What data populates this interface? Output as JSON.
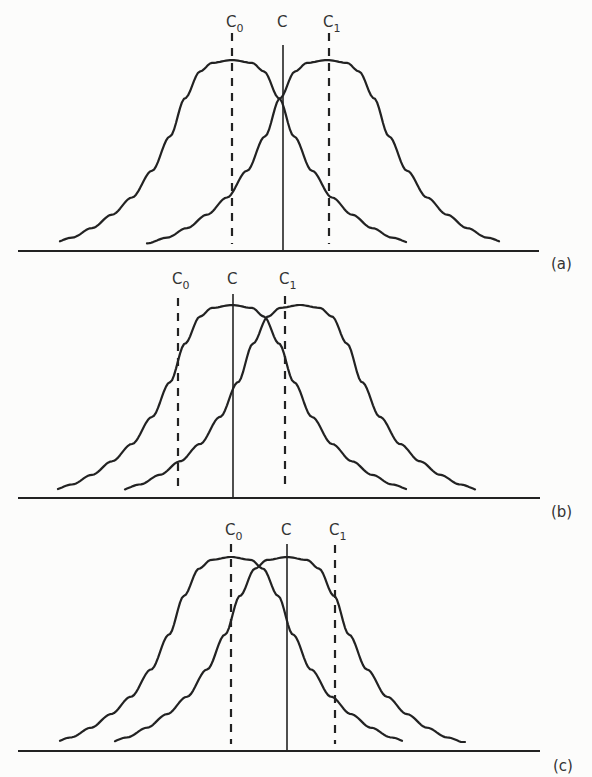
{
  "figure": {
    "colors": {
      "background": "#fcfcfb",
      "line": "#222222",
      "text": "#333333"
    },
    "panels": [
      {
        "id": "a",
        "tag": "(a)",
        "baseline_y": 251,
        "axis_x": [
          18,
          539
        ],
        "peak_y": 60,
        "curves": [
          {
            "name": "noise-distribution",
            "mean_x": 232,
            "start_x": 60,
            "end_x": 407,
            "tail_y": 243
          },
          {
            "name": "signal-distribution",
            "mean_x": 327,
            "start_x": 147,
            "end_x": 500,
            "tail_y": 244
          }
        ],
        "labels": {
          "c0": {
            "text": "C",
            "sub": "0",
            "x": 232,
            "line_top": 33,
            "line_bottom": 244,
            "dashed": true
          },
          "c": {
            "text": "C",
            "sub": "",
            "x": 283,
            "line_top": 45,
            "line_bottom": 251,
            "dashed": false
          },
          "c1": {
            "text": "C",
            "sub": "1",
            "x": 329,
            "line_top": 33,
            "line_bottom": 244,
            "dashed": true
          }
        },
        "label_y": 27,
        "tag_pos": [
          551,
          269
        ]
      },
      {
        "id": "b",
        "tag": "(b)",
        "baseline_y": 498,
        "axis_x": [
          18,
          540
        ],
        "peak_y": 305,
        "curves": [
          {
            "name": "noise-distribution",
            "mean_x": 232,
            "start_x": 58,
            "end_x": 407,
            "tail_y": 490
          },
          {
            "name": "signal-distribution",
            "mean_x": 300,
            "start_x": 125,
            "end_x": 475,
            "tail_y": 490
          }
        ],
        "labels": {
          "c0": {
            "text": "C",
            "sub": "0",
            "x": 178,
            "line_top": 298,
            "line_bottom": 491,
            "dashed": true
          },
          "c": {
            "text": "C",
            "sub": "",
            "x": 233,
            "line_top": 294,
            "line_bottom": 498,
            "dashed": false
          },
          "c1": {
            "text": "C",
            "sub": "1",
            "x": 285,
            "line_top": 296,
            "line_bottom": 491,
            "dashed": true
          }
        },
        "label_y": 284,
        "tag_pos": [
          551,
          517
        ]
      },
      {
        "id": "c",
        "tag": "(c)",
        "baseline_y": 751,
        "axis_x": [
          18,
          540
        ],
        "peak_y": 557,
        "curves": [
          {
            "name": "noise-distribution",
            "mean_x": 231,
            "start_x": 60,
            "end_x": 403,
            "tail_y": 743
          },
          {
            "name": "signal-distribution",
            "mean_x": 287,
            "start_x": 115,
            "end_x": 465,
            "tail_y": 742
          }
        ],
        "labels": {
          "c0": {
            "text": "C",
            "sub": "0",
            "x": 231,
            "line_top": 544,
            "line_bottom": 744,
            "dashed": true
          },
          "c": {
            "text": "C",
            "sub": "",
            "x": 287,
            "line_top": 544,
            "line_bottom": 751,
            "dashed": false
          },
          "c1": {
            "text": "C",
            "sub": "1",
            "x": 335,
            "line_top": 545,
            "line_bottom": 744,
            "dashed": true
          }
        },
        "label_y": 535,
        "tag_pos": [
          553,
          771
        ]
      }
    ]
  }
}
